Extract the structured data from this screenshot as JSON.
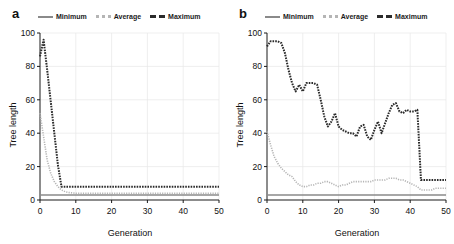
{
  "figure": {
    "background": "#ffffff",
    "panels": [
      {
        "label": "a",
        "legend": {
          "items": [
            {
              "name": "legend-minimum",
              "label": "Minimum",
              "style": "solid",
              "color": "#8a8a8a"
            },
            {
              "name": "legend-average",
              "label": "Average",
              "style": "dotted",
              "color": "#b5b5b5"
            },
            {
              "name": "legend-maximum",
              "label": "Maximum",
              "style": "dashed",
              "color": "#2b2b2b"
            }
          ]
        },
        "chart_data": {
          "type": "line",
          "title": "",
          "xlabel": "Generation",
          "ylabel": "Tree length",
          "xlim": [
            0,
            50
          ],
          "ylim": [
            0,
            100
          ],
          "xticks": [
            0,
            10,
            20,
            30,
            40,
            50
          ],
          "yticks": [
            0,
            20,
            40,
            60,
            80,
            100
          ],
          "grid": true,
          "legend_position": "above-axes",
          "x": [
            0,
            1,
            2,
            3,
            4,
            5,
            6,
            7,
            8,
            10,
            12,
            15,
            20,
            25,
            30,
            35,
            40,
            45,
            50
          ],
          "series": [
            {
              "name": "Minimum",
              "color": "#8a8a8a",
              "style": "solid",
              "values": [
                3,
                3,
                3,
                3,
                3,
                3,
                3,
                3,
                3,
                3,
                3,
                3,
                3,
                3,
                3,
                3,
                3,
                3,
                3
              ]
            },
            {
              "name": "Average",
              "color": "#b5b5b5",
              "style": "dotted",
              "values": [
                52,
                38,
                24,
                16,
                11,
                8,
                6,
                5,
                4.5,
                4,
                4,
                4,
                4,
                4,
                4,
                4,
                4,
                4,
                4
              ]
            },
            {
              "name": "Maximum",
              "color": "#2b2b2b",
              "style": "dashed",
              "values": [
                86,
                96,
                78,
                59,
                40,
                21,
                8,
                8,
                8,
                8,
                8,
                8,
                8,
                8,
                8,
                8,
                8,
                8,
                8
              ]
            }
          ]
        }
      },
      {
        "label": "b",
        "legend": {
          "items": [
            {
              "name": "legend-minimum",
              "label": "Minimum",
              "style": "solid",
              "color": "#8a8a8a"
            },
            {
              "name": "legend-average",
              "label": "Average",
              "style": "dotted",
              "color": "#b5b5b5"
            },
            {
              "name": "legend-maximum",
              "label": "Maximum",
              "style": "dashed",
              "color": "#2b2b2b"
            }
          ]
        },
        "chart_data": {
          "type": "line",
          "title": "",
          "xlabel": "Generation",
          "ylabel": "Tree length",
          "xlim": [
            0,
            50
          ],
          "ylim": [
            0,
            100
          ],
          "xticks": [
            0,
            10,
            20,
            30,
            40,
            50
          ],
          "yticks": [
            0,
            20,
            40,
            60,
            80,
            100
          ],
          "grid": true,
          "legend_position": "above-axes",
          "x": [
            0,
            1,
            2,
            3,
            4,
            5,
            6,
            7,
            8,
            9,
            10,
            11,
            12,
            13,
            14,
            15,
            16,
            17,
            18,
            19,
            20,
            21,
            22,
            23,
            24,
            25,
            26,
            27,
            28,
            29,
            30,
            31,
            32,
            33,
            34,
            35,
            36,
            37,
            38,
            39,
            40,
            41,
            42,
            43,
            44,
            45,
            46,
            47,
            48,
            49,
            50
          ],
          "series": [
            {
              "name": "Minimum",
              "color": "#8a8a8a",
              "style": "solid",
              "values": [
                3,
                3,
                3,
                3,
                3,
                3,
                3,
                3,
                3,
                3,
                3,
                3,
                3,
                3,
                3,
                3,
                3,
                3,
                3,
                3,
                3,
                3,
                3,
                3,
                3,
                3,
                3,
                3,
                3,
                3,
                3,
                3,
                3,
                3,
                3,
                3,
                3,
                3,
                3,
                3,
                3,
                3,
                3,
                3,
                3,
                3,
                3,
                3,
                3,
                3,
                3
              ]
            },
            {
              "name": "Average",
              "color": "#b5b5b5",
              "style": "dotted",
              "values": [
                41,
                33,
                26,
                22,
                19,
                17,
                15,
                14,
                11,
                9,
                8,
                8,
                9,
                9,
                10,
                10,
                11,
                11,
                10,
                9,
                8,
                9,
                9,
                10,
                11,
                11,
                11,
                11,
                11,
                11,
                12,
                12,
                12,
                12,
                13,
                13,
                13,
                12,
                12,
                11,
                10,
                9,
                8,
                6,
                6,
                6,
                6,
                7,
                7,
                7,
                7
              ]
            },
            {
              "name": "Maximum",
              "color": "#2b2b2b",
              "style": "dashed",
              "values": [
                92,
                95,
                95,
                95,
                94,
                88,
                78,
                70,
                65,
                69,
                65,
                70,
                70,
                70,
                69,
                60,
                50,
                44,
                47,
                52,
                44,
                42,
                41,
                40,
                40,
                38,
                44,
                45,
                38,
                36,
                42,
                47,
                40,
                46,
                52,
                57,
                58,
                53,
                52,
                54,
                53,
                53,
                54,
                12,
                12,
                12,
                12,
                12,
                12,
                12,
                12
              ]
            }
          ]
        }
      }
    ]
  }
}
